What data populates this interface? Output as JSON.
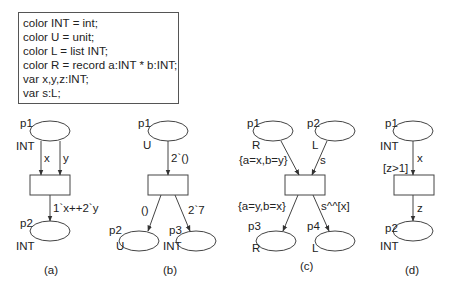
{
  "declarations": [
    "color INT = int;",
    "color U = unit;",
    "color L = list INT;",
    "color R = record a:INT * b:INT;",
    "var x,y,z:INT;",
    "var s:L;"
  ],
  "panels": {
    "a": {
      "caption": "(a)",
      "places": [
        {
          "name": "p1",
          "type": "INT"
        },
        {
          "name": "p2",
          "type": "INT"
        }
      ],
      "arcs": [
        "x",
        "y",
        "1`x++2`y"
      ]
    },
    "b": {
      "caption": "(b)",
      "places": [
        {
          "name": "p1",
          "type": "U"
        },
        {
          "name": "p2",
          "type": "U"
        },
        {
          "name": "p3",
          "type": "INT"
        }
      ],
      "arcs": [
        "2`()",
        "()",
        "2`7"
      ]
    },
    "c": {
      "caption": "(c)",
      "places": [
        {
          "name": "p1",
          "type": "R"
        },
        {
          "name": "p2",
          "type": "L"
        },
        {
          "name": "p3",
          "type": "R"
        },
        {
          "name": "p4",
          "type": "L"
        }
      ],
      "arcs": [
        "{a=x,b=y}",
        "s",
        "{a=y,b=x}",
        "s^^[x]"
      ]
    },
    "d": {
      "caption": "(d)",
      "places": [
        {
          "name": "p1",
          "type": "INT"
        },
        {
          "name": "p2",
          "type": "INT"
        }
      ],
      "guard": "[z>1]",
      "arcs": [
        "x",
        "z"
      ]
    }
  }
}
